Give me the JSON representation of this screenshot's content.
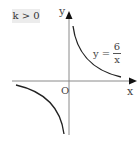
{
  "condition_label": "k > 0",
  "axes": {
    "x_label": "x",
    "y_label": "y",
    "origin_label": "O"
  },
  "equation": {
    "lhs": "y",
    "equals": "=",
    "numerator": "6",
    "denominator": "x"
  },
  "curves": [
    {
      "name": "first-quadrant-branch",
      "quadrant": "I"
    },
    {
      "name": "third-quadrant-branch",
      "quadrant": "III"
    }
  ],
  "colors": {
    "axis": "#888888",
    "curve": "#222222",
    "badge_bg": "#ececec"
  }
}
